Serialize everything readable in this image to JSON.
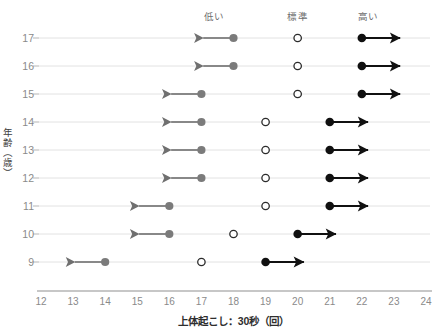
{
  "chart_data": {
    "type": "scatter",
    "title": "",
    "xlabel": "上体起こし：30秒（回）",
    "ylabel": "年齢（歳）",
    "xlim": [
      12,
      24
    ],
    "ylim": [
      8.5,
      17.5
    ],
    "xticks": [
      "12",
      "13",
      "14",
      "15",
      "16",
      "17",
      "18",
      "19",
      "20",
      "21",
      "22",
      "23",
      "24"
    ],
    "yticks": [
      "17",
      "16",
      "15",
      "14",
      "13",
      "12",
      "11",
      "10",
      "9"
    ],
    "grid": true,
    "legend_position": "top",
    "band_labels": [
      {
        "text": "低い",
        "x": 17.4
      },
      {
        "text": "標準",
        "x": 20.0
      },
      {
        "text": "高い",
        "x": 22.2
      }
    ],
    "series": [
      {
        "name": "低い",
        "marker": "filled-gray",
        "color": "#7f7f7f",
        "arrow": "left"
      },
      {
        "name": "標準",
        "marker": "open",
        "color": "#2b2b2b",
        "arrow": "none"
      },
      {
        "name": "高い",
        "marker": "filled-black",
        "color": "#121212",
        "arrow": "right"
      }
    ],
    "rows": [
      {
        "age": 17,
        "low": 18.0,
        "low_arrow_end": 16.9,
        "standard": 20.0,
        "high": 22.0,
        "high_arrow_end": 23.35
      },
      {
        "age": 16,
        "low": 18.0,
        "low_arrow_end": 16.9,
        "standard": 20.0,
        "high": 22.0,
        "high_arrow_end": 23.35
      },
      {
        "age": 15,
        "low": 17.0,
        "low_arrow_end": 15.9,
        "standard": 20.0,
        "high": 22.0,
        "high_arrow_end": 23.35
      },
      {
        "age": 14,
        "low": 17.0,
        "low_arrow_end": 15.9,
        "standard": 19.0,
        "high": 21.0,
        "high_arrow_end": 22.35
      },
      {
        "age": 13,
        "low": 17.0,
        "low_arrow_end": 15.9,
        "standard": 19.0,
        "high": 21.0,
        "high_arrow_end": 22.35
      },
      {
        "age": 12,
        "low": 17.0,
        "low_arrow_end": 15.9,
        "standard": 19.0,
        "high": 21.0,
        "high_arrow_end": 22.35
      },
      {
        "age": 11,
        "low": 16.0,
        "low_arrow_end": 14.9,
        "standard": 19.0,
        "high": 21.0,
        "high_arrow_end": 22.35
      },
      {
        "age": 10,
        "low": 16.0,
        "low_arrow_end": 14.9,
        "standard": 18.0,
        "high": 20.0,
        "high_arrow_end": 21.35
      },
      {
        "age": 9,
        "low": 14.0,
        "low_arrow_end": 12.9,
        "standard": 17.0,
        "high": 19.0,
        "high_arrow_end": 20.35
      }
    ]
  }
}
